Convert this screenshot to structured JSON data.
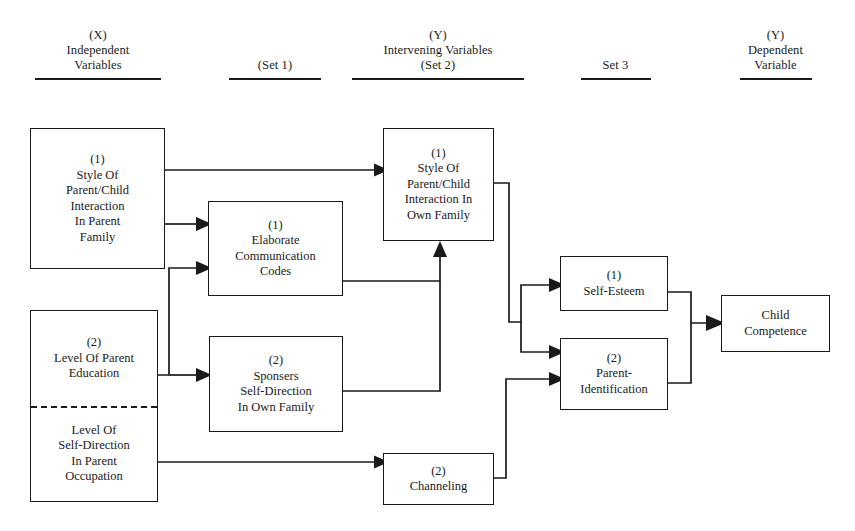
{
  "diagram": {
    "columns": [
      {
        "id": "independent",
        "line1": "(X)",
        "line2": "Independent",
        "line3": "Variables"
      },
      {
        "id": "set1",
        "line1": "",
        "line2": "(Set 1)",
        "line3": ""
      },
      {
        "id": "intervening",
        "line1": "(Y)",
        "line2": "Intervening Variables",
        "line3": "(Set 2)"
      },
      {
        "id": "set3",
        "line1": "",
        "line2": "Set 3",
        "line3": ""
      },
      {
        "id": "dependent",
        "line1": "(Y)",
        "line2": "Dependent",
        "line3": "Variable"
      }
    ],
    "nodes": [
      {
        "id": "style-parent-family",
        "tag": "(1)",
        "body": "Style Of\nParent/Child\nInteraction\nIn Parent\nFamily"
      },
      {
        "id": "parent-education",
        "tag": "(2)",
        "body": "Level Of Parent\nEducation"
      },
      {
        "id": "parent-occupation",
        "tag": "",
        "body": "Level Of\nSelf-Direction\nIn Parent\nOccupation"
      },
      {
        "id": "elaborate-codes",
        "tag": "(1)",
        "body": "Elaborate\nCommunication\nCodes"
      },
      {
        "id": "sponsers-self-direction",
        "tag": "(2)",
        "body": "Sponsers\nSelf-Direction\nIn Own Family"
      },
      {
        "id": "style-own-family",
        "tag": "(1)",
        "body": "Style Of\nParent/Child\nInteraction In\nOwn Family"
      },
      {
        "id": "channeling",
        "tag": "(2)",
        "body": "Channeling"
      },
      {
        "id": "self-esteem",
        "tag": "(1)",
        "body": "Self-Esteem"
      },
      {
        "id": "parent-identification",
        "tag": "(2)",
        "body": "Parent-\nIdentification"
      },
      {
        "id": "child-competence",
        "tag": "",
        "body": "Child\nCompetence"
      }
    ],
    "edges": [
      {
        "from": "style-parent-family",
        "to": "style-own-family"
      },
      {
        "from": "style-parent-family",
        "to": "elaborate-codes"
      },
      {
        "from": "parent-education",
        "to": "elaborate-codes"
      },
      {
        "from": "parent-education",
        "to": "sponsers-self-direction"
      },
      {
        "from": "elaborate-codes",
        "to": "style-own-family"
      },
      {
        "from": "sponsers-self-direction",
        "to": "style-own-family"
      },
      {
        "from": "parent-occupation",
        "to": "channeling"
      },
      {
        "from": "style-own-family",
        "to": "self-esteem"
      },
      {
        "from": "style-own-family",
        "to": "parent-identification"
      },
      {
        "from": "channeling",
        "to": "parent-identification"
      },
      {
        "from": "self-esteem",
        "to": "child-competence"
      },
      {
        "from": "parent-identification",
        "to": "child-competence"
      }
    ],
    "colors": {
      "ink": "#1a1a1a",
      "background": "#ffffff"
    }
  }
}
